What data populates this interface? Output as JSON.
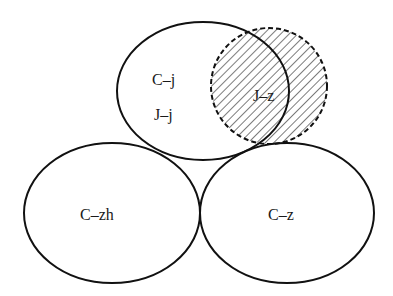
{
  "diagram": {
    "type": "venn-like ellipse diagram",
    "sets": [
      {
        "id": "top",
        "labels": [
          "C–j",
          "J–j"
        ],
        "style": "solid"
      },
      {
        "id": "hatched",
        "labels": [
          "J–z"
        ],
        "style": "dashed, hatched"
      },
      {
        "id": "bottom-left",
        "labels": [
          "C–zh"
        ],
        "style": "solid"
      },
      {
        "id": "bottom-right",
        "labels": [
          "C–z"
        ],
        "style": "solid"
      }
    ],
    "labels": {
      "cj": "C–j",
      "jj": "J–j",
      "jz": "J–z",
      "czh": "C–zh",
      "cz": "C–z"
    },
    "colors": {
      "stroke": "#111111",
      "background": "#ffffff"
    }
  }
}
